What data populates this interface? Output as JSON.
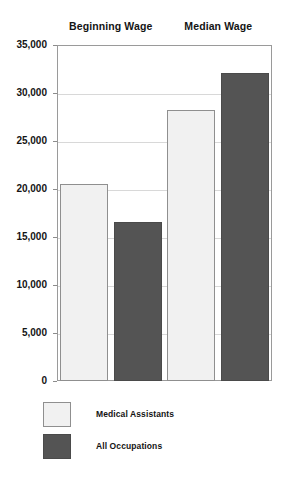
{
  "chart_data": {
    "type": "bar",
    "title": "",
    "subtitle": "",
    "xlabel": "",
    "ylabel": "",
    "categories": [
      "Beginning Wage",
      "Median Wage"
    ],
    "series": [
      {
        "name": "Medical Assistants",
        "values": [
          20500,
          28200
        ],
        "color": "#f1f1f1"
      },
      {
        "name": "All Occupations",
        "values": [
          16600,
          32100
        ],
        "color": "#545454"
      }
    ],
    "ylim": [
      0,
      35000
    ],
    "ytick_labels": [
      "35,000",
      "30,000",
      "25,000",
      "20,000",
      "15,000",
      "10,000",
      "5,000",
      "0"
    ],
    "ytick_values": [
      35000,
      30000,
      25000,
      20000,
      15000,
      10000,
      5000,
      0
    ],
    "grid": true,
    "legend_position": "bottom-left",
    "bar_order": [
      {
        "group": "Beginning Wage",
        "series": "Medical Assistants",
        "value": 20500,
        "style": "light"
      },
      {
        "group": "Beginning Wage",
        "series": "All Occupations",
        "value": 16600,
        "style": "dark"
      },
      {
        "group": "Median Wage",
        "series": "Medical Assistants",
        "value": 28200,
        "style": "light"
      },
      {
        "group": "Median Wage",
        "series": "All Occupations",
        "value": 32100,
        "style": "dark"
      }
    ]
  },
  "legend": {
    "items": [
      {
        "label": "Medical Assistants",
        "style": "light"
      },
      {
        "label": "All Occupations",
        "style": "dark"
      }
    ]
  }
}
